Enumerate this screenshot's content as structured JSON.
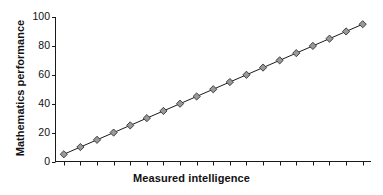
{
  "chart_data": {
    "type": "line",
    "title": "",
    "xlabel": "Measured intelligence",
    "ylabel": "Mathematics performance",
    "x": [
      1,
      2,
      3,
      4,
      5,
      6,
      7,
      8,
      9,
      10,
      11,
      12,
      13,
      14,
      15,
      16,
      17,
      18,
      19
    ],
    "values": [
      5,
      10,
      15,
      20,
      25,
      30,
      35,
      40,
      45,
      50,
      55,
      60,
      65,
      70,
      75,
      80,
      85,
      90,
      95
    ],
    "series": [
      {
        "name": "Mathematics performance",
        "values": [
          5,
          10,
          15,
          20,
          25,
          30,
          35,
          40,
          45,
          50,
          55,
          60,
          65,
          70,
          75,
          80,
          85,
          90,
          95
        ],
        "marker": "diamond",
        "marker_fill": "#999999",
        "marker_edge": "#333333",
        "line_color": "#1a1a1a"
      }
    ],
    "ylim": [
      0,
      100
    ],
    "yticks": [
      0,
      20,
      40,
      60,
      80,
      100
    ],
    "ytick_labels": [
      "0",
      "20",
      "40",
      "60",
      "80",
      "100"
    ],
    "xlim": [
      0.5,
      19.5
    ],
    "xtick_count": 19,
    "xtick_labels": [],
    "grid": false,
    "legend": false,
    "legend_position": "none",
    "background": "#ffffff",
    "axis_color": "#1a1a1a"
  }
}
